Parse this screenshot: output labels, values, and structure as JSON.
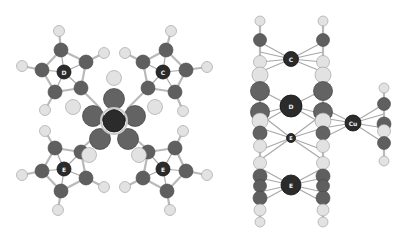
{
  "figure": {
    "views": [
      {
        "name": "top-view",
        "metal_labels": [
          "D",
          "C",
          "E",
          "E"
        ]
      },
      {
        "name": "side-view",
        "metal_labels": [
          "C",
          "D",
          "E",
          "E",
          "Cu"
        ]
      }
    ],
    "colors": {
      "background": "#ffffff",
      "carbon": "#5f5f5f",
      "hydrogen": "#e2e2e2",
      "metal": "#2b2b2b",
      "bond": "#b9b9b9"
    }
  }
}
